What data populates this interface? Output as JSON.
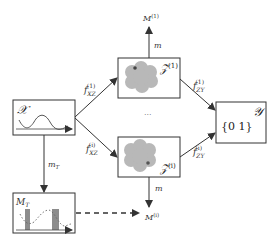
{
  "diagram": {
    "nodes": {
      "x_box": {
        "label": "𝒳"
      },
      "z1_box": {
        "label": "𝒵",
        "sup": "(1)"
      },
      "zi_box": {
        "label": "𝒵",
        "sup": "(i)"
      },
      "y_box": {
        "label": "𝒴",
        "content": "{0  1}"
      },
      "mt_box": {
        "label": "M",
        "sub": "T"
      },
      "m1_node": {
        "label": "M",
        "sup": "(1)"
      },
      "mi_node": {
        "label": "M",
        "sup": "(i)"
      }
    },
    "edges": {
      "x_to_z1": {
        "label": "f",
        "sub": "XZ",
        "sup": "(1)"
      },
      "x_to_zi": {
        "label": "f",
        "sub": "XZ",
        "sup": "(i)"
      },
      "z1_to_y": {
        "label": "f",
        "sub": "ZY",
        "sup": "(1)"
      },
      "zi_to_y": {
        "label": "f",
        "sub": "ZY",
        "sup": "(i)"
      },
      "z1_to_m1": {
        "label": "m"
      },
      "zi_to_mi": {
        "label": "m"
      },
      "x_to_mt": {
        "label": "m",
        "sub": "T"
      },
      "mt_to_mi": {
        "style": "dashed"
      }
    },
    "ellipsis": "···",
    "colors": {
      "stroke": "#333333",
      "blob": "#b8b8b8",
      "dot": "#555555",
      "bar": "#8c8c8c"
    }
  }
}
